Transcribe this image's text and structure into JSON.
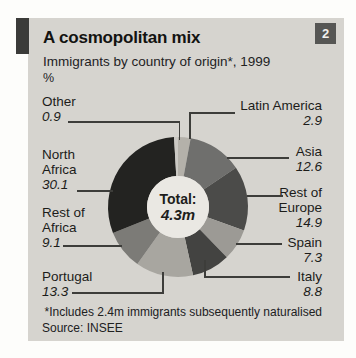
{
  "header": {
    "title": "A cosmopolitan mix",
    "subtitle": "Immigrants by country of origin*, 1999",
    "unit": "%",
    "index_badge": "2"
  },
  "chart_data": {
    "type": "pie",
    "style": "donut",
    "title": "A cosmopolitan mix",
    "subtitle": "Immigrants by country of origin*, 1999",
    "unit": "%",
    "center_label": "Total:",
    "center_value": "4.3m",
    "start_angle_deg": 0,
    "clockwise": true,
    "segments": [
      {
        "label": "Latin America",
        "value": 2.9,
        "color": "#b4b1aa"
      },
      {
        "label": "Asia",
        "value": 12.6,
        "color": "#6f6f6d"
      },
      {
        "label": "Rest of Europe",
        "value": 14.9,
        "color": "#4b4b49"
      },
      {
        "label": "Spain",
        "value": 7.3,
        "color": "#9c9a95"
      },
      {
        "label": "Italy",
        "value": 8.8,
        "color": "#434341"
      },
      {
        "label": "Portugal",
        "value": 13.3,
        "color": "#a8a6a0"
      },
      {
        "label": "Rest of Africa",
        "value": 9.1,
        "color": "#7c7b77"
      },
      {
        "label": "North Africa",
        "value": 30.1,
        "color": "#232321"
      },
      {
        "label": "Other",
        "value": 0.9,
        "color": "#cbc9c4"
      }
    ]
  },
  "footer": {
    "footnote": "*Includes 2.4m immigrants subsequently naturalised",
    "source": "Source: INSEE"
  }
}
